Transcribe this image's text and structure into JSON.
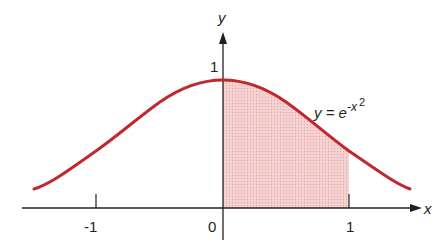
{
  "figure": {
    "function_label": {
      "lhs": "y = e",
      "exponent_base": "-x",
      "exponent_power": "2"
    },
    "axes": {
      "x_label": "x",
      "y_label": "y"
    },
    "x_ticks": [
      {
        "value": -1,
        "label": "-1"
      },
      {
        "value": 0,
        "label": "0"
      },
      {
        "value": 1,
        "label": "1"
      }
    ],
    "y_ticks": [
      {
        "value": 1,
        "label": "1"
      }
    ],
    "shaded_region": {
      "from": 0,
      "to": 1,
      "description": "area under curve from x=0 to x=1"
    },
    "colors": {
      "curve": "#c0282d",
      "shade": "#f2c6c6",
      "axis": "#231f20"
    }
  }
}
